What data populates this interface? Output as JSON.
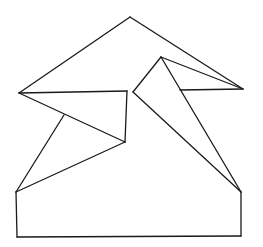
{
  "diagram": {
    "title": "",
    "stroke_color": "#1a1a1a",
    "background": "#ffffff",
    "points": {
      "A": [
        130,
        17
      ],
      "L": [
        19,
        93
      ],
      "R": [
        243,
        89
      ],
      "P": [
        161,
        57
      ],
      "M1": [
        127,
        91
      ],
      "M2": [
        133,
        92
      ],
      "V": [
        125,
        142
      ],
      "K": [
        64,
        115
      ],
      "BL": [
        16,
        192
      ],
      "BR": [
        241,
        192
      ],
      "BL2": [
        17,
        237
      ],
      "BR2": [
        241,
        236
      ],
      "Q": [
        180,
        90
      ]
    },
    "segments": [
      [
        "L",
        "A"
      ],
      [
        "A",
        "R"
      ],
      [
        "L",
        "M1"
      ],
      [
        "M1",
        "V"
      ],
      [
        "L",
        "V"
      ],
      [
        "K",
        "BL"
      ],
      [
        "V",
        "BL"
      ],
      [
        "M2",
        "P"
      ],
      [
        "P",
        "R"
      ],
      [
        "P",
        "BR"
      ],
      [
        "M2",
        "BR"
      ],
      [
        "Q",
        "R"
      ],
      [
        "BL",
        "BL2"
      ],
      [
        "BL2",
        "BR2"
      ],
      [
        "BR2",
        "BR"
      ]
    ]
  }
}
